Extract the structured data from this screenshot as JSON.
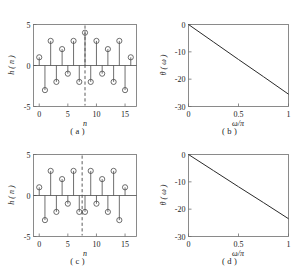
{
  "figure": {
    "panel_captions": {
      "a": "( a )",
      "b": "( b )",
      "c": "( c )",
      "d": "( d )"
    }
  },
  "chart_data": [
    {
      "id": "a",
      "type": "scatter",
      "subtype": "stem",
      "title": "",
      "caption": "( a )",
      "xlabel": "n",
      "ylabel": "h ( n )",
      "xlim": [
        -1,
        17
      ],
      "ylim": [
        -5,
        5
      ],
      "xticks": [
        0,
        5,
        10,
        15
      ],
      "xticklabels": [
        "0",
        "5",
        "10",
        "15"
      ],
      "yticks": [
        -5,
        0,
        5
      ],
      "yticklabels": [
        "-5",
        "0",
        "5"
      ],
      "grid": false,
      "legend": null,
      "x": [
        0,
        1,
        2,
        3,
        4,
        5,
        6,
        7,
        8,
        9,
        10,
        11,
        12,
        13,
        14,
        15,
        16
      ],
      "values": [
        1,
        -3,
        3,
        -2,
        2,
        -1,
        3,
        -2,
        4,
        -2,
        3,
        -1,
        2,
        -2,
        3,
        -3,
        1
      ],
      "annotations": [
        {
          "type": "vertical-dashed-line",
          "x": 8,
          "label": "symmetry axis n = 8"
        }
      ]
    },
    {
      "id": "b",
      "type": "line",
      "title": "",
      "caption": "( b )",
      "xlabel": "ω/π",
      "ylabel": "θ ( ω )",
      "xlim": [
        0,
        1
      ],
      "ylim": [
        -30,
        0
      ],
      "xticks": [
        0,
        0.5,
        1
      ],
      "xticklabels": [
        "0",
        "0.5",
        "1"
      ],
      "yticks": [
        0,
        -10,
        -20,
        -30
      ],
      "yticklabels": [
        "0",
        "-10",
        "-20",
        "-30"
      ],
      "grid": false,
      "legend": null,
      "series": [
        {
          "name": "phase",
          "x": [
            0,
            0.25,
            0.5,
            0.75,
            1
          ],
          "values": [
            0,
            -6.4,
            -12.8,
            -19.1,
            -25.5
          ]
        }
      ]
    },
    {
      "id": "c",
      "type": "scatter",
      "subtype": "stem",
      "title": "",
      "caption": "( c )",
      "xlabel": "n",
      "ylabel": "h ( n )",
      "xlim": [
        -1,
        17
      ],
      "ylim": [
        -5,
        5
      ],
      "xticks": [
        0,
        5,
        10,
        15
      ],
      "xticklabels": [
        "0",
        "5",
        "10",
        "15"
      ],
      "yticks": [
        -5,
        0,
        5
      ],
      "yticklabels": [
        "-5",
        "0",
        "5"
      ],
      "grid": false,
      "legend": null,
      "x": [
        0,
        1,
        2,
        3,
        4,
        5,
        6,
        7,
        8,
        9,
        10,
        11,
        12,
        13,
        14,
        15
      ],
      "values": [
        1,
        -3,
        3,
        -2,
        2,
        -1,
        3,
        -2,
        -2,
        3,
        -1,
        2,
        -2,
        3,
        -3,
        1
      ],
      "annotations": [
        {
          "type": "vertical-dashed-line",
          "x": 7.5,
          "label": "symmetry axis n = 7.5"
        }
      ]
    },
    {
      "id": "d",
      "type": "line",
      "title": "",
      "caption": "( d )",
      "xlabel": "ω/π",
      "ylabel": "θ ( ω )",
      "xlim": [
        0,
        1
      ],
      "ylim": [
        -30,
        0
      ],
      "xticks": [
        0,
        0.5,
        1
      ],
      "xticklabels": [
        "0",
        "0.5",
        "1"
      ],
      "yticks": [
        0,
        -10,
        -20,
        -30
      ],
      "yticklabels": [
        "0",
        "-10",
        "-20",
        "-30"
      ],
      "grid": false,
      "legend": null,
      "series": [
        {
          "name": "phase",
          "x": [
            0,
            0.25,
            0.5,
            0.75,
            1
          ],
          "values": [
            0,
            -5.9,
            -11.8,
            -17.6,
            -23.5
          ]
        }
      ]
    }
  ]
}
